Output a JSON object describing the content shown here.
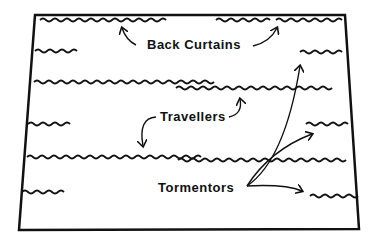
{
  "diagram": {
    "labels": {
      "back_curtains": "Back Curtains",
      "travellers": "Travellers",
      "tormentors": "Tormentors"
    },
    "stroke_color": "#111111",
    "background": "#ffffff"
  }
}
